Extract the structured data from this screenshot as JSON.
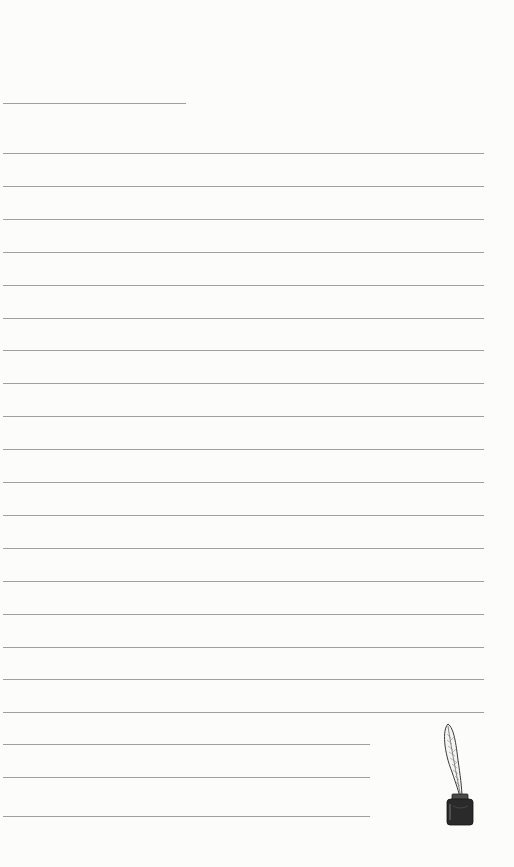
{
  "page": {
    "type": "lined-notepaper",
    "background_color": "#fcfcfb",
    "rule_color": "#8f8f8f"
  },
  "header_rule": {
    "y": 103,
    "x_start": 3,
    "x_end": 186
  },
  "full_rules": {
    "count": 18,
    "y_start": 153,
    "spacing": 32.9,
    "x_start": 3,
    "x_end": 484
  },
  "short_rules": {
    "positions_y": [
      744,
      777,
      816
    ],
    "x_start": 3,
    "x_end": 370
  },
  "illustration": {
    "name": "quill-and-inkwell",
    "ink_color": "#2a2a2a"
  }
}
